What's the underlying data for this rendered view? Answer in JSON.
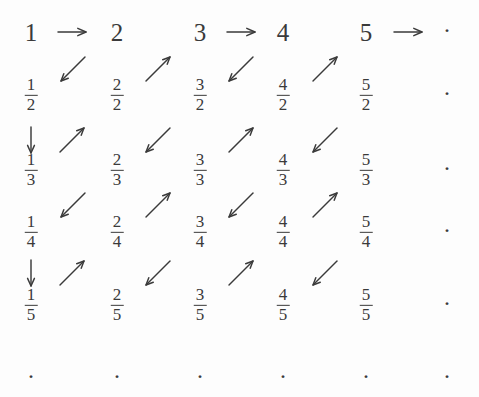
{
  "figure": {
    "background_color": "#fdfdfd",
    "ink_color": "#3a3a3a",
    "width": 479,
    "height": 397
  },
  "grid": {
    "column_count": 6,
    "row_count": 6,
    "column_x": [
      31,
      117,
      200,
      283,
      366,
      447
    ],
    "row_y": [
      32,
      95,
      170,
      232,
      305,
      378
    ],
    "ellipsis_glyph": "·"
  },
  "rows": [
    {
      "row_index": 0,
      "denominator": 1,
      "cells": [
        {
          "kind": "integer",
          "text": "1",
          "numerator": "1",
          "denominator": "1",
          "col": 0
        },
        {
          "kind": "integer",
          "text": "2",
          "numerator": "2",
          "denominator": "1",
          "col": 1
        },
        {
          "kind": "integer",
          "text": "3",
          "numerator": "3",
          "denominator": "1",
          "col": 2
        },
        {
          "kind": "integer",
          "text": "4",
          "numerator": "4",
          "denominator": "1",
          "col": 3
        },
        {
          "kind": "integer",
          "text": "5",
          "numerator": "5",
          "denominator": "1",
          "col": 4
        },
        {
          "kind": "ellipsis",
          "text": "·",
          "col": 5
        }
      ]
    },
    {
      "row_index": 1,
      "denominator": 2,
      "cells": [
        {
          "kind": "fraction",
          "numerator": "1",
          "denominator": "2",
          "col": 0
        },
        {
          "kind": "fraction",
          "numerator": "2",
          "denominator": "2",
          "col": 1
        },
        {
          "kind": "fraction",
          "numerator": "3",
          "denominator": "2",
          "col": 2
        },
        {
          "kind": "fraction",
          "numerator": "4",
          "denominator": "2",
          "col": 3
        },
        {
          "kind": "fraction",
          "numerator": "5",
          "denominator": "2",
          "col": 4
        },
        {
          "kind": "ellipsis",
          "text": "·",
          "col": 5
        }
      ]
    },
    {
      "row_index": 2,
      "denominator": 3,
      "cells": [
        {
          "kind": "fraction",
          "numerator": "1",
          "denominator": "3",
          "col": 0
        },
        {
          "kind": "fraction",
          "numerator": "2",
          "denominator": "3",
          "col": 1
        },
        {
          "kind": "fraction",
          "numerator": "3",
          "denominator": "3",
          "col": 2
        },
        {
          "kind": "fraction",
          "numerator": "4",
          "denominator": "3",
          "col": 3
        },
        {
          "kind": "fraction",
          "numerator": "5",
          "denominator": "3",
          "col": 4
        },
        {
          "kind": "ellipsis",
          "text": "·",
          "col": 5
        }
      ]
    },
    {
      "row_index": 3,
      "denominator": 4,
      "cells": [
        {
          "kind": "fraction",
          "numerator": "1",
          "denominator": "4",
          "col": 0
        },
        {
          "kind": "fraction",
          "numerator": "2",
          "denominator": "4",
          "col": 1
        },
        {
          "kind": "fraction",
          "numerator": "3",
          "denominator": "4",
          "col": 2
        },
        {
          "kind": "fraction",
          "numerator": "4",
          "denominator": "4",
          "col": 3
        },
        {
          "kind": "fraction",
          "numerator": "5",
          "denominator": "4",
          "col": 4
        },
        {
          "kind": "ellipsis",
          "text": "·",
          "col": 5
        }
      ]
    },
    {
      "row_index": 4,
      "denominator": 5,
      "cells": [
        {
          "kind": "fraction",
          "numerator": "1",
          "denominator": "5",
          "col": 0
        },
        {
          "kind": "fraction",
          "numerator": "2",
          "denominator": "5",
          "col": 1
        },
        {
          "kind": "fraction",
          "numerator": "3",
          "denominator": "5",
          "col": 2
        },
        {
          "kind": "fraction",
          "numerator": "4",
          "denominator": "5",
          "col": 3
        },
        {
          "kind": "fraction",
          "numerator": "5",
          "denominator": "5",
          "col": 4
        },
        {
          "kind": "ellipsis",
          "text": "·",
          "col": 5
        }
      ]
    },
    {
      "row_index": 5,
      "denominator": null,
      "cells": [
        {
          "kind": "ellipsis",
          "text": "·",
          "col": 0
        },
        {
          "kind": "ellipsis",
          "text": "·",
          "col": 1
        },
        {
          "kind": "ellipsis",
          "text": "·",
          "col": 2
        },
        {
          "kind": "ellipsis",
          "text": "·",
          "col": 3
        },
        {
          "kind": "ellipsis",
          "text": "·",
          "col": 4
        },
        {
          "kind": "ellipsis",
          "text": "·",
          "col": 5
        }
      ]
    }
  ],
  "arrows": [
    {
      "name": "arrow-right-1-to-2",
      "direction": "right",
      "glyph": "→",
      "x": 72,
      "y": 32,
      "size": 30
    },
    {
      "name": "arrow-right-3-to-4",
      "direction": "right",
      "glyph": "→",
      "x": 241,
      "y": 32,
      "size": 30
    },
    {
      "name": "arrow-right-5-to-dots",
      "direction": "right",
      "glyph": "→",
      "x": 408,
      "y": 32,
      "size": 30
    },
    {
      "name": "arrow-downleft-r1c2-to-r2c1",
      "direction": "down-left",
      "glyph": "↙",
      "x": 73,
      "y": 69,
      "size": 26
    },
    {
      "name": "arrow-upright-r2c2-to-r1c3",
      "direction": "up-right",
      "glyph": "↗",
      "x": 158,
      "y": 69,
      "size": 26
    },
    {
      "name": "arrow-downleft-r1c4-to-r2c3",
      "direction": "down-left",
      "glyph": "↙",
      "x": 241,
      "y": 69,
      "size": 26
    },
    {
      "name": "arrow-upright-r2c4-to-r1c5",
      "direction": "up-right",
      "glyph": "↗",
      "x": 325,
      "y": 69,
      "size": 26
    },
    {
      "name": "arrow-down-r2c1-to-r3c1",
      "direction": "down",
      "glyph": "↓",
      "x": 31,
      "y": 140,
      "size": 28
    },
    {
      "name": "arrow-upright-r3c1-to-r2c2",
      "direction": "up-right",
      "glyph": "↗",
      "x": 72,
      "y": 140,
      "size": 26
    },
    {
      "name": "arrow-downleft-r2c3-to-r3c2",
      "direction": "down-left",
      "glyph": "↙",
      "x": 158,
      "y": 140,
      "size": 26
    },
    {
      "name": "arrow-upright-r3c3-to-r2c4",
      "direction": "up-right",
      "glyph": "↗",
      "x": 241,
      "y": 140,
      "size": 26
    },
    {
      "name": "arrow-downleft-r2c5-to-r3c4",
      "direction": "down-left",
      "glyph": "↙",
      "x": 325,
      "y": 140,
      "size": 26
    },
    {
      "name": "arrow-downleft-r3c2-to-r4c1",
      "direction": "down-left",
      "glyph": "↙",
      "x": 73,
      "y": 205,
      "size": 26
    },
    {
      "name": "arrow-upright-r4c2-to-r3c3",
      "direction": "up-right",
      "glyph": "↗",
      "x": 158,
      "y": 205,
      "size": 26
    },
    {
      "name": "arrow-downleft-r3c4-to-r4c3",
      "direction": "down-left",
      "glyph": "↙",
      "x": 241,
      "y": 205,
      "size": 26
    },
    {
      "name": "arrow-upright-r4c4-to-r3c5",
      "direction": "up-right",
      "glyph": "↗",
      "x": 325,
      "y": 205,
      "size": 26
    },
    {
      "name": "arrow-down-r4c1-to-r5c1",
      "direction": "down",
      "glyph": "↓",
      "x": 31,
      "y": 273,
      "size": 28
    },
    {
      "name": "arrow-upright-r5c1-to-r4c2",
      "direction": "up-right",
      "glyph": "↗",
      "x": 72,
      "y": 273,
      "size": 26
    },
    {
      "name": "arrow-downleft-r4c3-to-r5c2",
      "direction": "down-left",
      "glyph": "↙",
      "x": 158,
      "y": 273,
      "size": 26
    },
    {
      "name": "arrow-upright-r5c3-to-r4c4",
      "direction": "up-right",
      "glyph": "↗",
      "x": 241,
      "y": 273,
      "size": 26
    },
    {
      "name": "arrow-downleft-r4c5-to-r5c4",
      "direction": "down-left",
      "glyph": "↙",
      "x": 325,
      "y": 273,
      "size": 26
    }
  ]
}
